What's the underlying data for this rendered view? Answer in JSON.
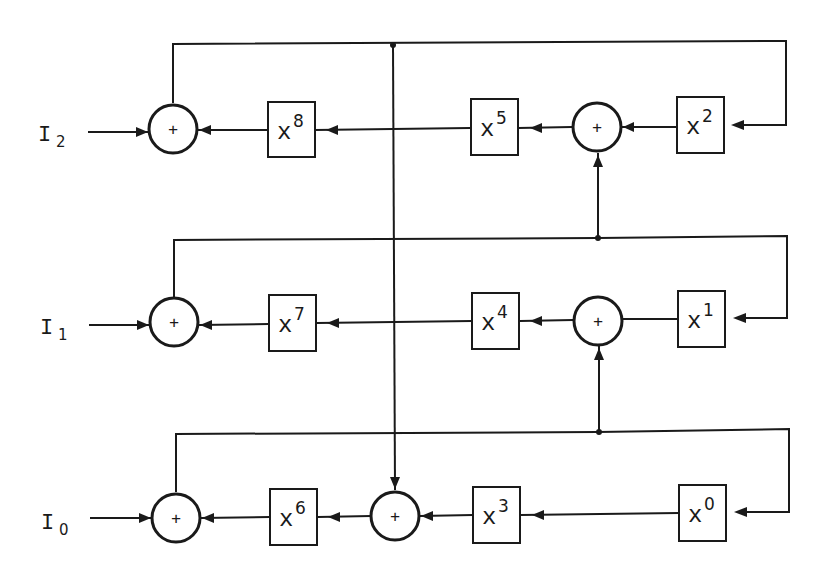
{
  "diagram": {
    "type": "block-diagram",
    "inputs": [
      {
        "id": "I2",
        "base": "I",
        "sub": "2"
      },
      {
        "id": "I1",
        "base": "I",
        "sub": "1"
      },
      {
        "id": "I0",
        "base": "I",
        "sub": "0"
      }
    ],
    "adder_symbol": "+",
    "rows": [
      {
        "input": "I2",
        "blocks": [
          {
            "base": "x",
            "exp": "8"
          },
          {
            "base": "x",
            "exp": "5"
          },
          {
            "base": "x",
            "exp": "2"
          }
        ]
      },
      {
        "input": "I1",
        "blocks": [
          {
            "base": "x",
            "exp": "7"
          },
          {
            "base": "x",
            "exp": "4"
          },
          {
            "base": "x",
            "exp": "1"
          }
        ]
      },
      {
        "input": "I0",
        "blocks": [
          {
            "base": "x",
            "exp": "6"
          },
          {
            "base": "x",
            "exp": "3"
          },
          {
            "base": "x",
            "exp": "0"
          }
        ]
      }
    ]
  }
}
